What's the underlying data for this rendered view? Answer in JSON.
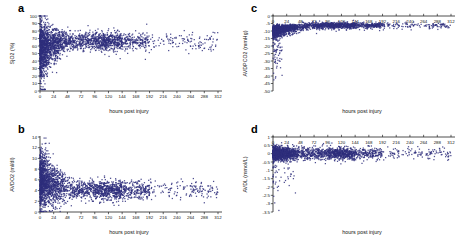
{
  "figure": {
    "background": "#ffffff",
    "marker_color": "#2f2f7d",
    "axis_color": "#222222"
  },
  "panels": [
    {
      "letter": "a",
      "xlabel": "hours post injury",
      "ylabel": "SjO2 (%)",
      "yticks": [
        0,
        10,
        20,
        30,
        40,
        50,
        60,
        70,
        80,
        90,
        100
      ],
      "xticks": [
        0,
        24,
        48,
        72,
        96,
        120,
        144,
        168,
        192,
        216,
        240,
        264,
        288,
        312
      ],
      "xlim": [
        0,
        312
      ],
      "ylim": [
        0,
        100
      ],
      "xticks_at_top": false
    },
    {
      "letter": "b",
      "xlabel": "hours post injury",
      "ylabel": "AVDO2 (ml/dl)",
      "yticks": [
        0,
        2,
        4,
        6,
        8,
        10,
        12,
        14
      ],
      "xticks": [
        0,
        24,
        48,
        72,
        96,
        120,
        144,
        168,
        192,
        216,
        240,
        264,
        288,
        312
      ],
      "xlim": [
        0,
        312
      ],
      "ylim": [
        0,
        14
      ],
      "xticks_at_top": false
    },
    {
      "letter": "c",
      "xlabel": "hours post injury",
      "ylabel": "AVDPCO2 (mmHg)",
      "yticks": [
        0,
        -5,
        -10,
        -15,
        -20,
        -25,
        -30,
        -35,
        -40,
        -45,
        -50
      ],
      "xticks": [
        0,
        24,
        48,
        72,
        96,
        120,
        144,
        168,
        192,
        216,
        240,
        264,
        288,
        312
      ],
      "xlim": [
        0,
        312
      ],
      "ylim": [
        -50,
        0
      ],
      "xticks_at_top": true
    },
    {
      "letter": "d",
      "xlabel": "hours post injury",
      "ylabel": "AVDL (mmol/L)",
      "yticks": [
        1,
        0.5,
        0,
        -0.5,
        -1,
        -1.5,
        -2,
        -2.5,
        -3,
        -3.5
      ],
      "xticks": [
        0,
        24,
        48,
        72,
        96,
        120,
        144,
        168,
        192,
        216,
        240,
        264,
        288,
        312
      ],
      "xlim": [
        0,
        312
      ],
      "ylim": [
        -3.5,
        1
      ],
      "xticks_at_top": true
    }
  ],
  "chart_data": [
    {
      "type": "scatter",
      "panel": "a",
      "title": "",
      "xlabel": "hours post injury",
      "ylabel": "SjO2 (%)",
      "xlim": [
        0,
        312
      ],
      "ylim": [
        0,
        100
      ],
      "xticks": [
        0,
        24,
        48,
        72,
        96,
        120,
        144,
        168,
        192,
        216,
        240,
        264,
        288,
        312
      ],
      "yticks": [
        0,
        10,
        20,
        30,
        40,
        50,
        60,
        70,
        80,
        90,
        100
      ],
      "grid": false,
      "legend": "none",
      "marker_color": "#2f2f7d",
      "description": "Jugular venous oxygen saturation versus hours post injury. Dense cloud centred near 65% with very wide vertical spread (15-100%) in the first 24 hours, narrowing to roughly 55-80% after 48 hours; point density thins progressively beyond 168 hours with sparse isolated points out to 312 hours.",
      "n_points_approx": 2600,
      "median_y": 66,
      "spread_early_y": [
        15,
        100
      ],
      "spread_late_y": [
        50,
        82
      ]
    },
    {
      "type": "scatter",
      "panel": "b",
      "title": "",
      "xlabel": "hours post injury",
      "ylabel": "AVDO2 (ml/dl)",
      "xlim": [
        0,
        312
      ],
      "ylim": [
        0,
        14
      ],
      "xticks": [
        0,
        24,
        48,
        72,
        96,
        120,
        144,
        168,
        192,
        216,
        240,
        264,
        288,
        312
      ],
      "yticks": [
        0,
        2,
        4,
        6,
        8,
        10,
        12,
        14
      ],
      "grid": false,
      "legend": "none",
      "marker_color": "#2f2f7d",
      "description": "Arterio-venous oxygen difference versus hours post injury. Values start high and widely scattered (1-13 ml/dl) within the first 24 hours, converge to a tight band around 4 ml/dl after 48 hours, and become sparse beyond 192 hours.",
      "n_points_approx": 2600,
      "median_y": 4.2,
      "spread_early_y": [
        1,
        13
      ],
      "spread_late_y": [
        2.5,
        6.5
      ]
    },
    {
      "type": "scatter",
      "panel": "c",
      "title": "",
      "xlabel": "hours post injury",
      "ylabel": "AVDPCO2 (mmHg)",
      "xlim": [
        0,
        312
      ],
      "ylim": [
        -50,
        0
      ],
      "xticks": [
        0,
        24,
        48,
        72,
        96,
        120,
        144,
        168,
        192,
        216,
        240,
        264,
        288,
        312
      ],
      "yticks": [
        0,
        -5,
        -10,
        -15,
        -20,
        -25,
        -30,
        -35,
        -40,
        -45,
        -50
      ],
      "grid": false,
      "legend": "none",
      "marker_color": "#2f2f7d",
      "description": "Arterio-venous PCO2 difference versus hours post injury. Tight dense band just below zero (about -5 to -10 mmHg) across the whole time range, with a long tail of negative outliers reaching -50 mmHg concentrated in the first 24 hours. X tick labels are drawn near the top of the axis.",
      "n_points_approx": 2600,
      "median_y": -7,
      "spread_early_y": [
        -50,
        -2
      ],
      "spread_late_y": [
        -12,
        -2
      ]
    },
    {
      "type": "scatter",
      "panel": "d",
      "title": "",
      "xlabel": "hours post injury",
      "ylabel": "AVDL (mmol/L)",
      "xlim": [
        0,
        312
      ],
      "ylim": [
        -3.5,
        1
      ],
      "xticks": [
        0,
        24,
        48,
        72,
        96,
        120,
        144,
        168,
        192,
        216,
        240,
        264,
        288,
        312
      ],
      "yticks": [
        1,
        0.5,
        0,
        -0.5,
        -1,
        -1.5,
        -2,
        -2.5,
        -3,
        -3.5
      ],
      "grid": false,
      "legend": "none",
      "marker_color": "#2f2f7d",
      "description": "Arterio-venous lactate difference versus hours post injury. Extremely tight dense band centred on 0 mmol/L spanning roughly -0.5 to +0.5 across the full time range, with scattered negative outliers down to -3.4 mmol/L in the first 24-48 hours. X tick labels are overlapped by the dense band.",
      "n_points_approx": 2600,
      "median_y": 0.0,
      "spread_early_y": [
        -3.4,
        0.6
      ],
      "spread_late_y": [
        -0.3,
        0.3
      ]
    }
  ]
}
